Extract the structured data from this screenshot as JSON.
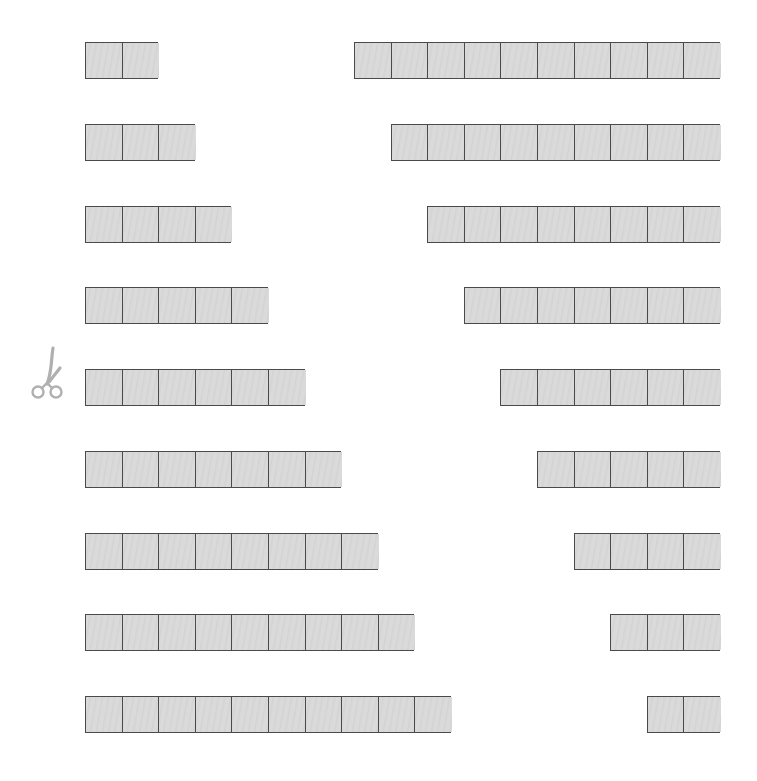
{
  "worksheet": {
    "cell_width": 36.6,
    "row_pitch": 81.75,
    "first_row_top": 42,
    "left_start_x": 85,
    "right_end_x": 720,
    "colors": {
      "fill": "#d9d9d9",
      "border": "#4a4a4a",
      "scissors": "#b0b0b0"
    },
    "scissors_icon": "scissors-icon",
    "rows": [
      {
        "left_cells": 2,
        "right_cells": 10
      },
      {
        "left_cells": 3,
        "right_cells": 9
      },
      {
        "left_cells": 4,
        "right_cells": 8
      },
      {
        "left_cells": 5,
        "right_cells": 7
      },
      {
        "left_cells": 6,
        "right_cells": 6
      },
      {
        "left_cells": 7,
        "right_cells": 5
      },
      {
        "left_cells": 8,
        "right_cells": 4
      },
      {
        "left_cells": 9,
        "right_cells": 3
      },
      {
        "left_cells": 10,
        "right_cells": 2
      }
    ]
  }
}
